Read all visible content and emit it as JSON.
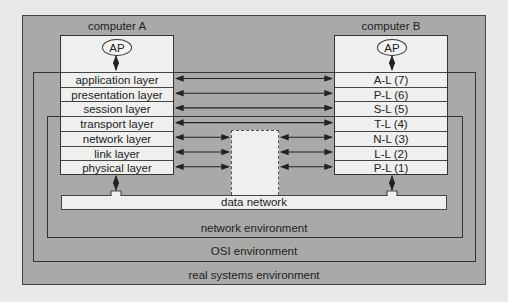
{
  "computer_a": {
    "title": "computer A",
    "ap_label": "AP",
    "layers": [
      "application layer",
      "presentation layer",
      "session layer",
      "transport layer",
      "network layer",
      "link layer",
      "physical layer"
    ]
  },
  "computer_b": {
    "title": "computer B",
    "ap_label": "AP",
    "layers": [
      "A-L (7)",
      "P-L (6)",
      "S-L (5)",
      "T-L (4)",
      "N-L (3)",
      "L-L (2)",
      "P-L (1)"
    ]
  },
  "data_network": {
    "label": "data network"
  },
  "environments": {
    "network": "network environment",
    "osi": "OSI environment",
    "real_systems": "real systems environment"
  },
  "colors": {
    "background": "#e9e9e7",
    "environment_fill": "#a9a9a7",
    "box_fill": "#efefed",
    "line": "#333333"
  }
}
